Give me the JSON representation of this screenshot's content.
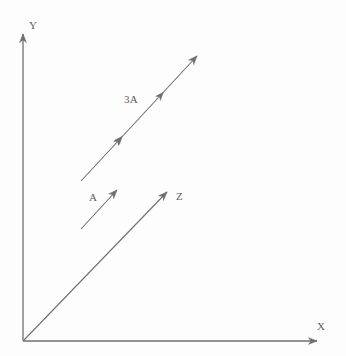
{
  "figure": {
    "background_color": "#fdfdfd",
    "stroke_color": "#6f6f6f",
    "text_color": "#5d5d5d",
    "width": 346,
    "height": 356
  },
  "axes": {
    "origin": {
      "x": 23,
      "y": 341
    },
    "x_axis": {
      "label": "X",
      "name": "x-axis",
      "from": {
        "x": 23,
        "y": 341
      },
      "to": {
        "x": 322,
        "y": 341
      },
      "arrowhead": true,
      "label_pos": {
        "x": 317,
        "y": 321
      }
    },
    "y_axis": {
      "label": "Y",
      "name": "y-axis",
      "from": {
        "x": 23,
        "y": 341
      },
      "to": {
        "x": 23,
        "y": 29
      },
      "arrowhead": true,
      "label_pos": {
        "x": 29,
        "y": 20
      }
    }
  },
  "vectors": [
    {
      "id": "vector-a",
      "label": "A",
      "from": {
        "x": 81,
        "y": 229
      },
      "to": {
        "x": 122,
        "y": 185
      },
      "arrowheads": [
        {
          "x": 122,
          "y": 185
        }
      ],
      "label_pos": {
        "x": 89,
        "y": 192
      },
      "magnitude_units": 1,
      "description": "Vector A, drawn free (not from origin), pointing up and to the right at about 45 degrees"
    },
    {
      "id": "vector-3a",
      "label": "3A",
      "from": {
        "x": 81,
        "y": 181
      },
      "to": {
        "x": 202,
        "y": 51
      },
      "arrowheads": [
        {
          "x": 119,
          "y": 140
        },
        {
          "x": 160,
          "y": 96
        },
        {
          "x": 202,
          "y": 51
        }
      ],
      "label_pos": {
        "x": 124,
        "y": 94
      },
      "magnitude_units": 3,
      "description": "Vector 3A, three times the length of A in the same direction, with intermediate arrowheads marking each unit segment"
    },
    {
      "id": "vector-z",
      "label": "Z",
      "from": {
        "x": 23,
        "y": 341
      },
      "to": {
        "x": 172,
        "y": 187
      },
      "arrowheads": [
        {
          "x": 172,
          "y": 187
        }
      ],
      "label_pos": {
        "x": 176,
        "y": 191
      },
      "magnitude_units": null,
      "description": "Vector Z drawn from the origin, parallel to A and 3A"
    }
  ]
}
